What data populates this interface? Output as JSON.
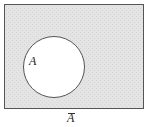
{
  "diagram": {
    "type": "venn",
    "universe": {
      "fill": "#e3e3e3",
      "stroke": "#555555"
    },
    "set": {
      "label": "A",
      "fill": "#ffffff",
      "stroke": "#555555"
    },
    "complement_label": "A"
  }
}
